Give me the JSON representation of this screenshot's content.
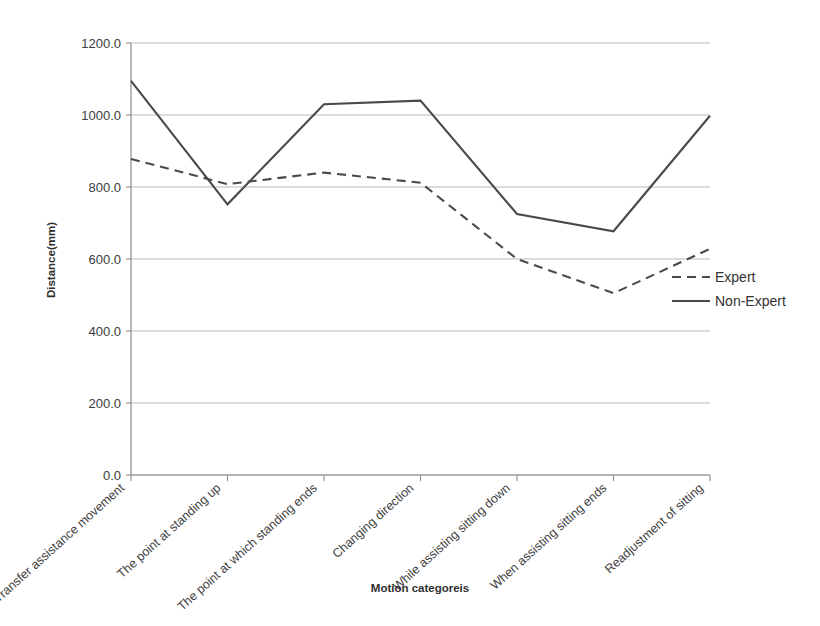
{
  "chart_data": {
    "type": "line",
    "title": "",
    "xlabel": "Motion categoreis",
    "ylabel": "Distance(mm)",
    "ylim": [
      0,
      1200
    ],
    "ytick_step": 200,
    "grid": true,
    "legend_position": "right",
    "categories": [
      "Transfer assistance movement",
      "The point at standing up",
      "The point at which standing ends",
      "Changing direction",
      "While assisting sitting down",
      "When assisting sitting ends",
      "Readjustment of sitting"
    ],
    "ytick_labels": [
      "0.0",
      "200.0",
      "400.0",
      "600.0",
      "800.0",
      "1000.0",
      "1200.0"
    ],
    "ytick_values": [
      0,
      200,
      400,
      600,
      800,
      1000,
      1200
    ],
    "series": [
      {
        "name": "Expert",
        "style": "dashed",
        "color": "#4a4a4a",
        "values": [
          878,
          808,
          840,
          812,
          600,
          505,
          628
        ]
      },
      {
        "name": "Non-Expert",
        "style": "solid",
        "color": "#4a4a4a",
        "values": [
          1095,
          752,
          1030,
          1040,
          725,
          677,
          998
        ]
      }
    ]
  },
  "legend": {
    "entries": [
      {
        "label": "Expert",
        "style": "dashed"
      },
      {
        "label": "Non-Expert",
        "style": "solid"
      }
    ]
  },
  "axes": {
    "y_title": "Distance(mm)",
    "x_title": "Motion categoreis"
  }
}
